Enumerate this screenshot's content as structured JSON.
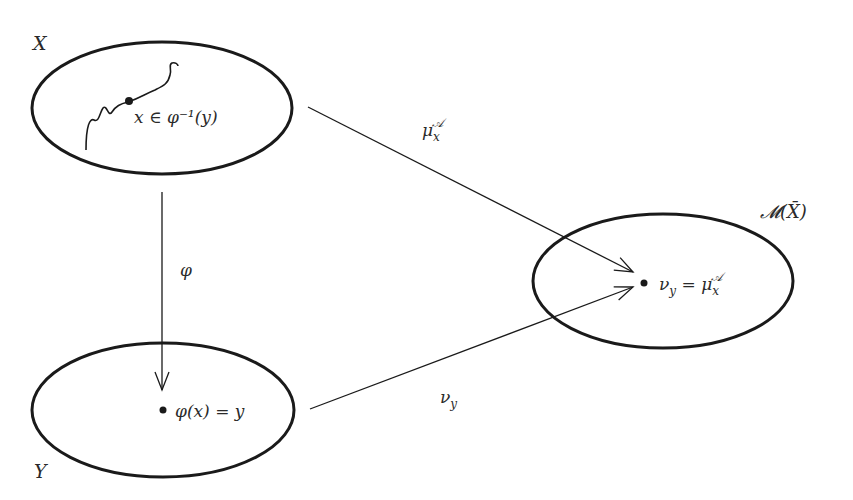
{
  "diagram": {
    "sets": {
      "X": {
        "label": "X"
      },
      "Y": {
        "label": "Y"
      },
      "M": {
        "label": "𝓜(X̄)"
      }
    },
    "points": {
      "x_point": {
        "label": "x ∈ φ⁻¹(y)"
      },
      "y_point": {
        "label": "φ(x) = y"
      },
      "nu_point": {
        "label": "ν_y = μ_x^𝒜",
        "lhs": "ν",
        "lhs_sub": "y",
        "eq": " = ",
        "rhs": "μ",
        "rhs_sub": "x",
        "rhs_sup": "𝒜"
      }
    },
    "arrows": {
      "phi": {
        "label": "φ"
      },
      "mu": {
        "label": "μ",
        "sub": "x",
        "sup": "𝒜"
      },
      "nu": {
        "label": "ν",
        "sub": "y"
      }
    },
    "colors": {
      "stroke": "#1a1a1a",
      "text": "#2a2a2a",
      "background": "#ffffff"
    }
  }
}
